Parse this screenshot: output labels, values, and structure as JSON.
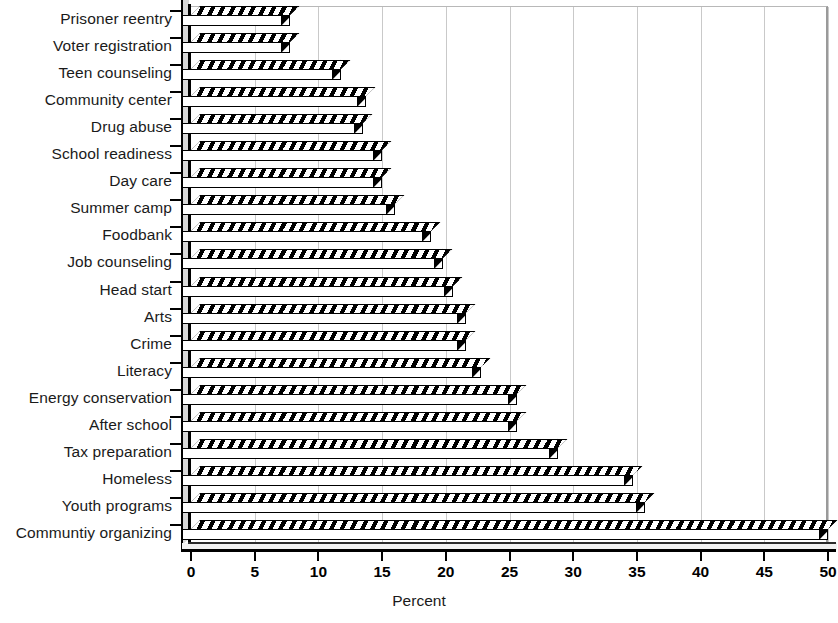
{
  "chart_data": {
    "type": "bar",
    "orientation": "horizontal",
    "title": "",
    "subtitle": "",
    "xlabel": "Percent",
    "ylabel": "",
    "xlim": [
      0,
      50
    ],
    "xticks": [
      0,
      5,
      10,
      15,
      20,
      25,
      30,
      35,
      40,
      45,
      50
    ],
    "xticklabels": [
      "0",
      "5",
      "10",
      "15",
      "20",
      "25",
      "30",
      "35",
      "40",
      "45",
      "50"
    ],
    "grid": "vertical",
    "legend": "none",
    "bar_style": "3d-hatched",
    "colors": {
      "bar_fill": "#ffffff",
      "bar_hatch": "#000000",
      "gridline": "#c9c9c9",
      "axis": "#000000",
      "text": "#1a1a1a"
    },
    "categories": [
      "Prisoner reentry",
      "Voter registration",
      "Teen counseling",
      "Community center",
      "Drug abuse",
      "School readiness",
      "Day care",
      "Summer camp",
      "Foodbank",
      "Job counseling",
      "Head start",
      "Arts",
      "Crime",
      "Literacy",
      "Energy conservation",
      "After school",
      "Tax preparation",
      "Homeless",
      "Youth programs",
      "Communtiy organizing"
    ],
    "values": [
      7.8,
      7.8,
      11.8,
      13.7,
      13.5,
      15.0,
      15.0,
      16.0,
      18.8,
      19.8,
      20.6,
      21.6,
      21.6,
      22.8,
      25.6,
      25.6,
      28.8,
      34.7,
      35.6,
      50.0
    ]
  }
}
